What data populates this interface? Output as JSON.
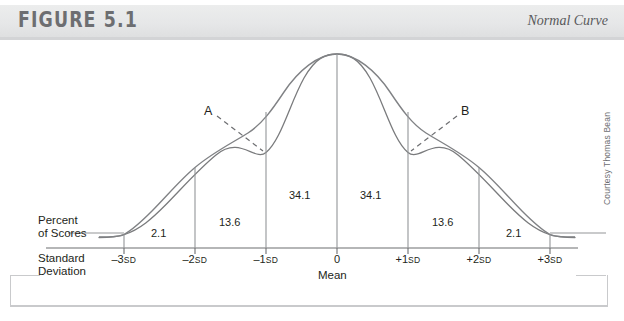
{
  "header": {
    "figure_label": "FIGURE 5.1",
    "title": "Normal Curve",
    "band_color": "#e6e7e8",
    "label_color": "#6d6e71"
  },
  "credit": "Courtesy Thomas Bean",
  "axis_labels": {
    "percent_line1": "Percent",
    "percent_line2": "of Scores",
    "sd_line1": "Standard",
    "sd_line2": "Deviation",
    "mean": "Mean"
  },
  "callouts": [
    {
      "label": "A",
      "x": 208,
      "y": 112,
      "tip_x": 264,
      "tip_y": 153
    },
    {
      "label": "B",
      "x": 464,
      "y": 112,
      "tip_x": 410,
      "tip_y": 153
    }
  ],
  "chart_data": {
    "type": "area",
    "title": "Normal Curve",
    "xlabel": "Standard Deviation",
    "ylabel": "Percent of Scores",
    "grid": false,
    "legend": null,
    "curve": "gaussian",
    "x_tick_values": [
      -3,
      -2,
      -1,
      0,
      1,
      2,
      3
    ],
    "x_tick_labels": [
      "–3",
      "–2",
      "–1",
      "0",
      "+1",
      "+2",
      "+3"
    ],
    "x_tick_suffixes": [
      "SD",
      "SD",
      "SD",
      "",
      "SD",
      "SD",
      "SD"
    ],
    "x_tick_px": [
      124,
      195,
      266,
      337,
      408,
      479,
      550
    ],
    "mean_tick_index": 3,
    "bands": [
      {
        "from": -3,
        "to": -2,
        "value": "2.1",
        "center_px": 159,
        "label_y": 233
      },
      {
        "from": -2,
        "to": -1,
        "value": "13.6",
        "center_px": 230,
        "label_y": 222
      },
      {
        "from": -1,
        "to": 0,
        "value": "34.1",
        "center_px": 301,
        "label_y": 195
      },
      {
        "from": 0,
        "to": 1,
        "value": "34.1",
        "center_px": 372,
        "label_y": 195
      },
      {
        "from": 1,
        "to": 2,
        "value": "13.6",
        "center_px": 443,
        "label_y": 222
      },
      {
        "from": 2,
        "to": 3,
        "value": "2.1",
        "center_px": 514,
        "label_y": 233
      }
    ],
    "values": [
      2.1,
      13.6,
      34.1,
      34.1,
      13.6,
      2.1
    ],
    "categories": [
      "-3SD to -2SD",
      "-2SD to -1SD",
      "-1SD to 0",
      "0 to +1SD",
      "+1SD to +2SD",
      "+2SD to +3SD"
    ],
    "ylim": [
      0,
      40
    ],
    "axis_color": "#6d6e71",
    "curve_color": "#6d6e71"
  }
}
